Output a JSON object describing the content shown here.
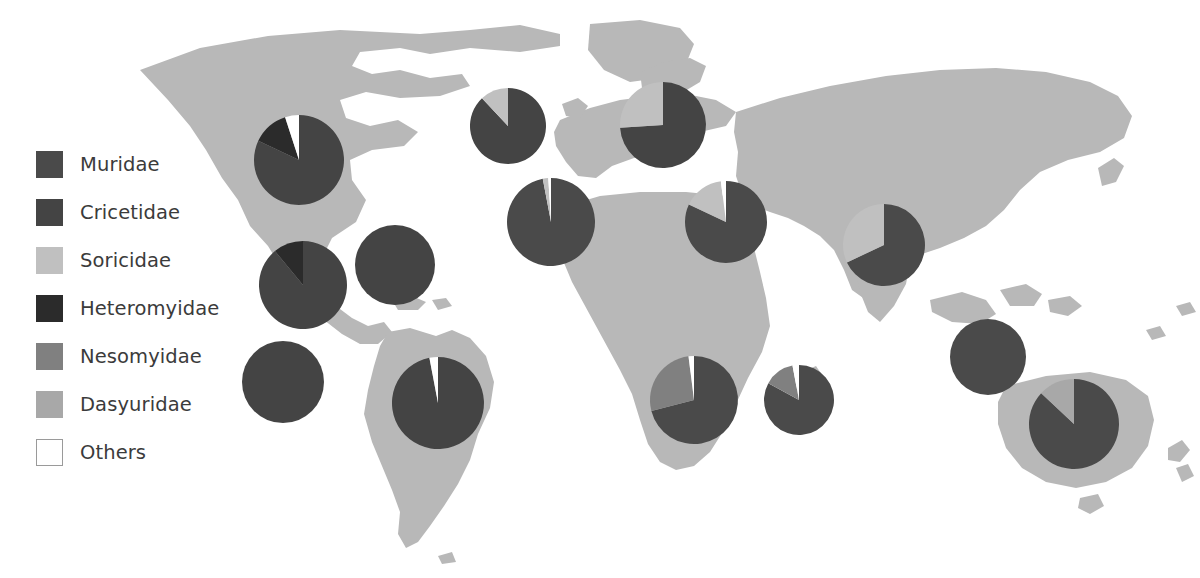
{
  "figure": {
    "kind": "world-map-with-pie-charts",
    "background_color": "#ffffff",
    "land_color": "#b8b8b8",
    "width": 1200,
    "height": 578
  },
  "legend": {
    "name": "family-legend",
    "items": [
      {
        "label": "Muridae",
        "color": "#4a4a4a",
        "outlined": false
      },
      {
        "label": "Cricetidae",
        "color": "#444444",
        "outlined": false
      },
      {
        "label": "Soricidae",
        "color": "#c0c0c0",
        "outlined": false
      },
      {
        "label": "Heteromyidae",
        "color": "#2b2b2b",
        "outlined": false
      },
      {
        "label": "Nesomyidae",
        "color": "#808080",
        "outlined": false
      },
      {
        "label": "Dasyuridae",
        "color": "#a8a8a8",
        "outlined": false
      },
      {
        "label": "Others",
        "color": "#ffffff",
        "outlined": true
      }
    ]
  },
  "chart_data": {
    "type": "pie",
    "title": "",
    "subtitle": "",
    "xlabel": "",
    "ylabel": "",
    "legend_position": "left",
    "grid": false,
    "categories": [
      "Muridae",
      "Cricetidae",
      "Soricidae",
      "Heteromyidae",
      "Nesomyidae",
      "Dasyuridae",
      "Others"
    ],
    "colors": [
      "#4a4a4a",
      "#444444",
      "#c0c0c0",
      "#2b2b2b",
      "#808080",
      "#a8a8a8",
      "#ffffff"
    ],
    "value_unit": "percent",
    "charts": [
      {
        "name": "pie-nearctic-north",
        "cx": 299,
        "cy": 160,
        "r": 45,
        "start_angle": 0,
        "values": [
          0,
          82,
          0,
          13,
          0,
          0,
          5
        ]
      },
      {
        "name": "pie-nearctic-southwest",
        "cx": 303,
        "cy": 285,
        "r": 44,
        "start_angle": 0,
        "values": [
          0,
          89,
          0,
          11,
          0,
          0,
          0
        ]
      },
      {
        "name": "pie-neotropic-caribbean",
        "cx": 395,
        "cy": 265,
        "r": 40,
        "start_angle": 0,
        "values": [
          0,
          100,
          0,
          0,
          0,
          0,
          0
        ]
      },
      {
        "name": "pie-neotropic-northwest",
        "cx": 283,
        "cy": 382,
        "r": 41,
        "start_angle": 0,
        "values": [
          0,
          100,
          0,
          0,
          0,
          0,
          0
        ]
      },
      {
        "name": "pie-neotropic-south",
        "cx": 438,
        "cy": 403,
        "r": 46,
        "start_angle": 0,
        "values": [
          0,
          97,
          0,
          0,
          0,
          0,
          3
        ]
      },
      {
        "name": "pie-palearctic-arctic",
        "cx": 508,
        "cy": 126,
        "r": 38,
        "start_angle": 0,
        "values": [
          0,
          88,
          12,
          0,
          0,
          0,
          0
        ]
      },
      {
        "name": "pie-palearctic-europe",
        "cx": 663,
        "cy": 125,
        "r": 43,
        "start_angle": 0,
        "values": [
          0,
          74,
          26,
          0,
          0,
          0,
          0
        ]
      },
      {
        "name": "pie-palearctic-mediterranean",
        "cx": 551,
        "cy": 222,
        "r": 44,
        "start_angle": 0,
        "values": [
          97,
          0,
          2,
          0,
          0,
          0,
          1
        ]
      },
      {
        "name": "pie-palearctic-middle-east",
        "cx": 726,
        "cy": 222,
        "r": 41,
        "start_angle": 0,
        "values": [
          82,
          0,
          16,
          0,
          0,
          0,
          2
        ]
      },
      {
        "name": "pie-indomalaya",
        "cx": 884,
        "cy": 245,
        "r": 41,
        "start_angle": 0,
        "values": [
          68,
          0,
          32,
          0,
          0,
          0,
          0
        ]
      },
      {
        "name": "pie-afrotropic-west",
        "cx": 694,
        "cy": 400,
        "r": 44,
        "start_angle": 0,
        "values": [
          71,
          0,
          0,
          0,
          27,
          0,
          2
        ]
      },
      {
        "name": "pie-afrotropic-south",
        "cx": 799,
        "cy": 400,
        "r": 35,
        "start_angle": 0,
        "values": [
          83,
          0,
          0,
          0,
          14,
          0,
          3
        ]
      },
      {
        "name": "pie-oceania-island",
        "cx": 988,
        "cy": 357,
        "r": 38,
        "start_angle": 0,
        "values": [
          100,
          0,
          0,
          0,
          0,
          0,
          0
        ]
      },
      {
        "name": "pie-australasia",
        "cx": 1074,
        "cy": 424,
        "r": 45,
        "start_angle": 0,
        "values": [
          87,
          0,
          0,
          0,
          0,
          13,
          0
        ]
      }
    ]
  }
}
